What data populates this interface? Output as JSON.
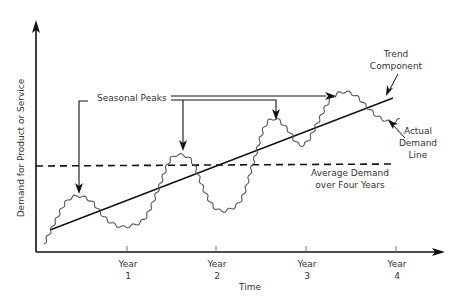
{
  "chart_data": {
    "type": "line",
    "title": "",
    "xlabel": "Time",
    "ylabel": "Demand for Product or Service",
    "x_ticks": [
      "Year 1",
      "Year 2",
      "Year 3",
      "Year 4"
    ],
    "grid": false,
    "series": [
      {
        "name": "Actual Demand Line",
        "style": "wavy seasonal",
        "x": [
          0.05,
          0.4,
          0.8,
          1.0,
          1.4,
          1.65,
          2.0,
          2.3,
          2.65,
          3.0,
          3.3,
          3.6,
          3.85
        ],
        "y": [
          0.1,
          0.33,
          0.55,
          0.2,
          0.45,
          0.62,
          0.5,
          0.45,
          0.72,
          0.63,
          0.82,
          0.77,
          0.74
        ]
      },
      {
        "name": "Trend Component",
        "style": "straight line",
        "x": [
          0.1,
          3.85
        ],
        "y": [
          0.12,
          0.75
        ]
      },
      {
        "name": "Average Demand over Four Years",
        "style": "dashed horizontal",
        "x": [
          0,
          3.85
        ],
        "y": [
          0.47,
          0.47
        ]
      }
    ],
    "annotations": [
      {
        "text": "Seasonal Peaks",
        "points_to": [
          "Year 0.5 peak",
          "Year 1.6 peak",
          "Year 2.6 peak",
          "Year 3.4 peak"
        ]
      },
      {
        "text": "Trend Component",
        "points_to": "trend line"
      },
      {
        "text": "Actual Demand Line",
        "points_to": "wavy demand line"
      },
      {
        "text": "Average Demand over Four Years",
        "points_to": "dashed line"
      }
    ]
  },
  "labels": {
    "y_axis": "Demand for Product or Service",
    "x_axis": "Time",
    "ticks": [
      {
        "line1": "Year",
        "line2": "1"
      },
      {
        "line1": "Year",
        "line2": "2"
      },
      {
        "line1": "Year",
        "line2": "3"
      },
      {
        "line1": "Year",
        "line2": "4"
      }
    ],
    "seasonal_peaks": "Seasonal Peaks",
    "trend_line1": "Trend",
    "trend_line2": "Component",
    "actual_line1": "Actual",
    "actual_line2": "Demand",
    "actual_line3": "Line",
    "average_line1": "Average Demand",
    "average_line2": "over Four Years"
  },
  "colors": {
    "axis": "#111111",
    "demand": "#555555",
    "text": "#333333"
  }
}
